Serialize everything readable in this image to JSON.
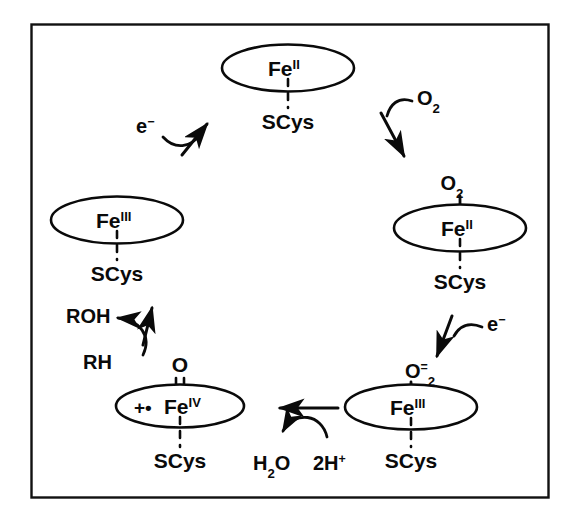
{
  "figure": {
    "kind": "reaction-cycle-diagram",
    "frame": {
      "border_color": "#111111"
    },
    "background_color": "#ffffff",
    "ink_color": "#0a0a0a"
  },
  "species": [
    {
      "id": "ferrous",
      "position": "top",
      "center_label": "Fe",
      "center_superscript": "II",
      "axial_below_label": "SCys",
      "axial_below_bond": "dashed",
      "axial_above_label": "",
      "axial_above_superscript": "",
      "axial_above_bond": "none",
      "radical_marker": ""
    },
    {
      "id": "oxy-ferrous",
      "position": "right",
      "center_label": "Fe",
      "center_superscript": "II",
      "axial_below_label": "SCys",
      "axial_below_bond": "dashed",
      "axial_above_label": "O",
      "axial_above_subscript": "2",
      "axial_above_superscript": "",
      "axial_above_bond": "single",
      "radical_marker": ""
    },
    {
      "id": "peroxo-ferric",
      "position": "bottom-right",
      "center_label": "Fe",
      "center_superscript": "III",
      "axial_below_label": "SCys",
      "axial_below_bond": "dashed",
      "axial_above_label": "O",
      "axial_above_subscript": "2",
      "axial_above_superscript": "=",
      "axial_above_bond": "single",
      "radical_marker": ""
    },
    {
      "id": "compound-one",
      "position": "bottom-left",
      "center_label": "Fe",
      "center_superscript": "IV",
      "axial_below_label": "SCys",
      "axial_below_bond": "dashed",
      "axial_above_label": "O",
      "axial_above_subscript": "",
      "axial_above_superscript": "",
      "axial_above_bond": "double",
      "radical_marker": "+•"
    },
    {
      "id": "ferric-resting",
      "position": "left",
      "center_label": "Fe",
      "center_superscript": "III",
      "axial_below_label": "SCys",
      "axial_below_bond": "dashed",
      "axial_above_label": "",
      "axial_above_superscript": "",
      "axial_above_bond": "none",
      "radical_marker": ""
    }
  ],
  "reagents": {
    "electron_top_left": {
      "label": "e",
      "superscript": "−"
    },
    "dioxygen": {
      "label": "O",
      "subscript": "2"
    },
    "electron_right": {
      "label": "e",
      "superscript": "−"
    },
    "protons": {
      "prefix": "2H",
      "superscript": "+"
    },
    "water": {
      "label": "H",
      "subscript": "2",
      "suffix": "O"
    },
    "substrate": {
      "label": "RH"
    },
    "product": {
      "label": "ROH"
    }
  },
  "steps": [
    {
      "from": "ferric-resting",
      "to": "ferrous",
      "adds": "e−",
      "arrow": "curved-up-right"
    },
    {
      "from": "ferrous",
      "to": "oxy-ferrous",
      "adds": "O2",
      "arrow": "curved-down-right"
    },
    {
      "from": "oxy-ferrous",
      "to": "peroxo-ferric",
      "adds": "e−",
      "arrow": "curved-down-left"
    },
    {
      "from": "peroxo-ferric",
      "to": "compound-one",
      "adds": "2H+",
      "releases": "H2O",
      "arrow": "straight-left"
    },
    {
      "from": "compound-one",
      "to": "ferric-resting",
      "adds": "RH",
      "releases": "ROH",
      "arrow": "curved-up"
    }
  ]
}
